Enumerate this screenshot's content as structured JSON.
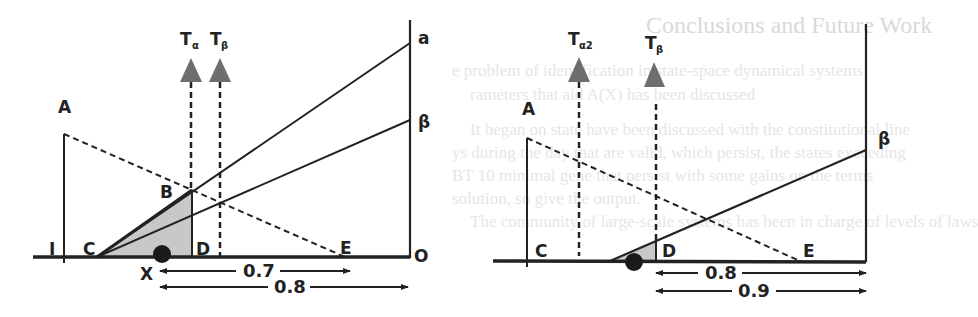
{
  "background_bleed": {
    "title": "Conclusions and Future Work",
    "lines": [
      "e problem of identification in state-space dynamical systems",
      "rameters that aid A(X) has been discussed",
      "It began on state have been discussed with the constitutional line",
      "ys during the day that are valid, which persist, the states exceeding",
      "BT 10 minimal gene that persist with some gains on the terms",
      "solution, so give the output.",
      "The community of large-scale systems has been in charge of levels of laws"
    ]
  },
  "colors": {
    "line": "#222222",
    "shade": "#c8c8c8",
    "arrow_fill": "#6e6e6e",
    "dot": "#1a1a1a",
    "background": "#ffffff"
  },
  "left_diagram": {
    "labels": {
      "A": "A",
      "I": "I",
      "C": "C",
      "B": "B",
      "D": "D",
      "E": "E",
      "O": "O",
      "X": "X",
      "a": "a",
      "beta": "β",
      "t_alpha_main": "T",
      "t_alpha_sub": "α",
      "t_beta_main": "T",
      "t_beta_sub": "β"
    },
    "measurements": {
      "short": "0.7",
      "long": "0.8"
    }
  },
  "right_diagram": {
    "labels": {
      "A": "A",
      "C": "C",
      "D": "D",
      "E": "E",
      "beta": "β",
      "t_alpha2_main": "T",
      "t_alpha2_sub": "α2",
      "t_beta_main": "T",
      "t_beta_sub": "β"
    },
    "measurements": {
      "short": "0.8",
      "long": "0.9"
    }
  }
}
